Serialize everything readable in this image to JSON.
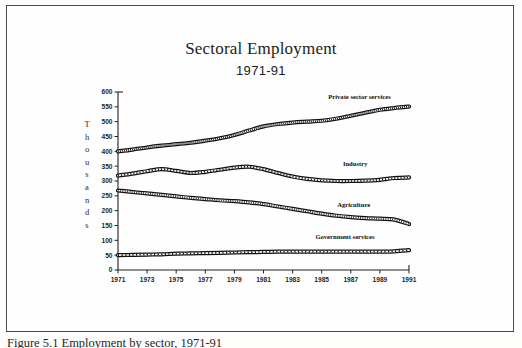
{
  "figure": {
    "caption": "Figure 5.1  Employment by sector, 1971-91"
  },
  "chart_data": {
    "type": "line",
    "title": "Sectoral Employment",
    "subtitle": "1971-91",
    "xlabel": "",
    "ylabel": "Thousands",
    "ylabel_letters": [
      "T",
      "h",
      "o",
      "u",
      "s",
      "a",
      "n",
      "d",
      "s"
    ],
    "xlim": [
      1971,
      1991
    ],
    "ylim": [
      0,
      600
    ],
    "ytick_values": [
      0,
      50,
      100,
      150,
      200,
      250,
      300,
      350,
      400,
      450,
      500,
      550,
      600
    ],
    "ytick_labels": [
      "0",
      "50",
      "100",
      "150",
      "200",
      "250",
      "300",
      "350",
      "400",
      "450",
      "500",
      "550",
      "600"
    ],
    "xtick_values": [
      1971,
      1973,
      1975,
      1977,
      1979,
      1981,
      1983,
      1985,
      1987,
      1989,
      1991
    ],
    "xtick_labels": [
      "1971",
      "1973",
      "1975",
      "1977",
      "1979",
      "1981",
      "1983",
      "1985",
      "1987",
      "1989",
      "1991"
    ],
    "x": [
      1971,
      1972,
      1973,
      1974,
      1975,
      1976,
      1977,
      1978,
      1979,
      1980,
      1981,
      1982,
      1983,
      1984,
      1985,
      1986,
      1987,
      1988,
      1989,
      1990,
      1991
    ],
    "grid": false,
    "legend_position": "inline-right",
    "series": [
      {
        "name": "Private sector services",
        "label": "Private sector services",
        "color": "#111111",
        "label_x": 1987.6,
        "label_y": 578,
        "values": [
          400,
          406,
          413,
          419,
          424,
          429,
          436,
          444,
          455,
          470,
          484,
          492,
          497,
          500,
          503,
          510,
          520,
          530,
          540,
          546,
          551
        ]
      },
      {
        "name": "Industry",
        "label": "Industry",
        "color": "#111111",
        "label_x": 1987.3,
        "label_y": 352,
        "values": [
          318,
          325,
          333,
          340,
          334,
          327,
          331,
          338,
          345,
          348,
          340,
          327,
          315,
          307,
          302,
          300,
          300,
          301,
          304,
          310,
          312
        ]
      },
      {
        "name": "Agriculture",
        "label": "Agriculture",
        "color": "#111111",
        "label_x": 1987.2,
        "label_y": 214,
        "values": [
          268,
          263,
          258,
          253,
          248,
          243,
          239,
          235,
          232,
          228,
          222,
          214,
          206,
          198,
          190,
          183,
          178,
          175,
          173,
          170,
          155
        ]
      },
      {
        "name": "Government services",
        "label": "Government services",
        "color": "#111111",
        "label_x": 1986.6,
        "label_y": 103,
        "values": [
          50,
          51,
          52,
          53,
          55,
          56,
          57,
          58,
          59,
          60,
          61,
          62,
          62,
          62,
          62,
          62,
          62,
          62,
          62,
          63,
          67
        ]
      }
    ]
  }
}
